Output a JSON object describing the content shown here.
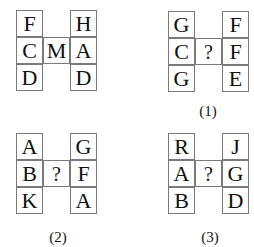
{
  "puzzles": [
    {
      "label": "",
      "left": [
        "F",
        "C",
        "D"
      ],
      "middle": "M",
      "right": [
        "H",
        "A",
        "D"
      ]
    },
    {
      "label": "(1)",
      "left": [
        "G",
        "C",
        "G"
      ],
      "middle": "?",
      "right": [
        "F",
        "F",
        "E"
      ]
    },
    {
      "label": "(2)",
      "left": [
        "A",
        "B",
        "K"
      ],
      "middle": "?",
      "right": [
        "G",
        "F",
        "A"
      ]
    },
    {
      "label": "(3)",
      "left": [
        "R",
        "A",
        "B"
      ],
      "middle": "?",
      "right": [
        "J",
        "G",
        "D"
      ]
    }
  ],
  "colors": {
    "border": "#7a7a7a",
    "text": "#111111"
  }
}
